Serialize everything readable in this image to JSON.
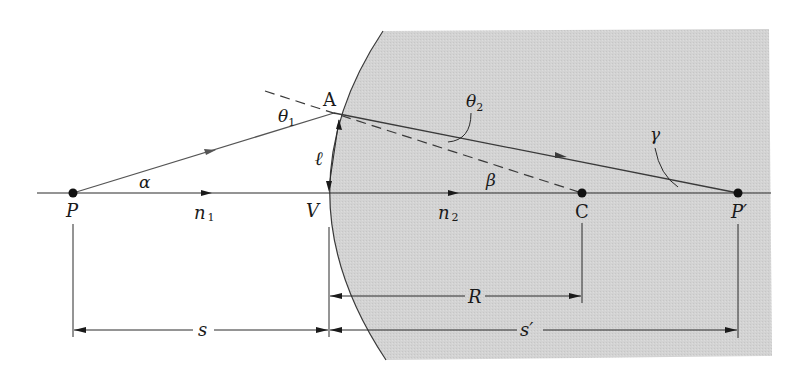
{
  "figure": {
    "colors": {
      "background": "#ffffff",
      "medium2": "#d2d2d2",
      "line": "#2a2a2a",
      "ray": "#555555"
    }
  },
  "points": {
    "object": {
      "label": "P"
    },
    "vertex": {
      "label": "V"
    },
    "center": {
      "label": "C"
    },
    "image": {
      "label": "P′"
    },
    "incidence": {
      "label": "A"
    }
  },
  "angles": {
    "alpha": "α",
    "beta": "β",
    "gamma": "γ",
    "theta1": "θ",
    "theta1_sub": "1",
    "theta2": "θ",
    "theta2_sub": "2"
  },
  "media": {
    "n1": "n",
    "n1_sub": "1",
    "n2": "n",
    "n2_sub": "2"
  },
  "lengths": {
    "height": "ℓ",
    "object_distance": "s",
    "radius": "R",
    "image_distance": "s′"
  }
}
